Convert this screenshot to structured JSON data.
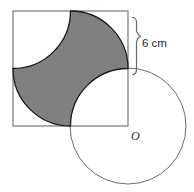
{
  "figure": {
    "labels": {
      "dimension": "6 cm",
      "centre_point": "O"
    },
    "colors": {
      "shaded_fill": "#808080",
      "shaded_stroke": "#1a1a1a",
      "square_stroke": "#6b6b6b",
      "circle_stroke": "#6b6b6b",
      "brace_stroke": "#6b6b6b",
      "background": "#ffffff",
      "text": "#2b2b2b"
    },
    "geometry": {
      "square": {
        "x": 13,
        "y": 11,
        "side": 115,
        "left": 13,
        "top": 11,
        "right": 128,
        "bottom": 126
      },
      "arc_radius": 57.5,
      "astroid": {
        "description": "four-pointed star formed by four quarter-circle arcs of radius 57.5 centred at the square corners",
        "cusp_top": [
          70.5,
          11
        ],
        "cusp_right": [
          128,
          68.5
        ],
        "cusp_bottom": [
          70.5,
          126
        ],
        "cusp_left": [
          13,
          68.5
        ]
      },
      "circle": {
        "cx": 128,
        "cy": 126,
        "r": 58,
        "centre_label": "O"
      },
      "brace": {
        "x": 136,
        "y_top": 11,
        "y_bottom": 68.5,
        "span_label": "6 cm",
        "label_x": 142,
        "label_y": 43
      }
    }
  }
}
